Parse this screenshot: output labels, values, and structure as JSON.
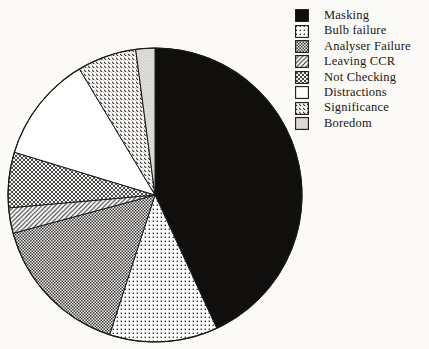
{
  "figure": {
    "kind": "scanned pie chart figure",
    "background_color": "#fbfaf7",
    "ink_color": "#161513"
  },
  "chart_data": {
    "type": "pie",
    "title": "",
    "legend_position": "top-right",
    "direction": "clockwise",
    "start_angle_deg": 0,
    "center": {
      "x": 155,
      "y": 195,
      "radius": 147
    },
    "slices": [
      {
        "label": "Masking",
        "percent": 43.1,
        "pattern": "solid-black"
      },
      {
        "label": "Bulb failure",
        "percent": 11.9,
        "pattern": "dots-light"
      },
      {
        "label": "Analyser Failure",
        "percent": 15.8,
        "pattern": "checker-dense"
      },
      {
        "label": "Leaving CCR",
        "percent": 2.8,
        "pattern": "hatch-forward"
      },
      {
        "label": "Not Checking",
        "percent": 6.1,
        "pattern": "crosshatch"
      },
      {
        "label": "Distractions",
        "percent": 11.7,
        "pattern": "plain-white"
      },
      {
        "label": "Significance",
        "percent": 6.5,
        "pattern": "hatch-back"
      },
      {
        "label": "Boredom",
        "percent": 2.1,
        "pattern": "dots-fine-gray"
      }
    ]
  }
}
